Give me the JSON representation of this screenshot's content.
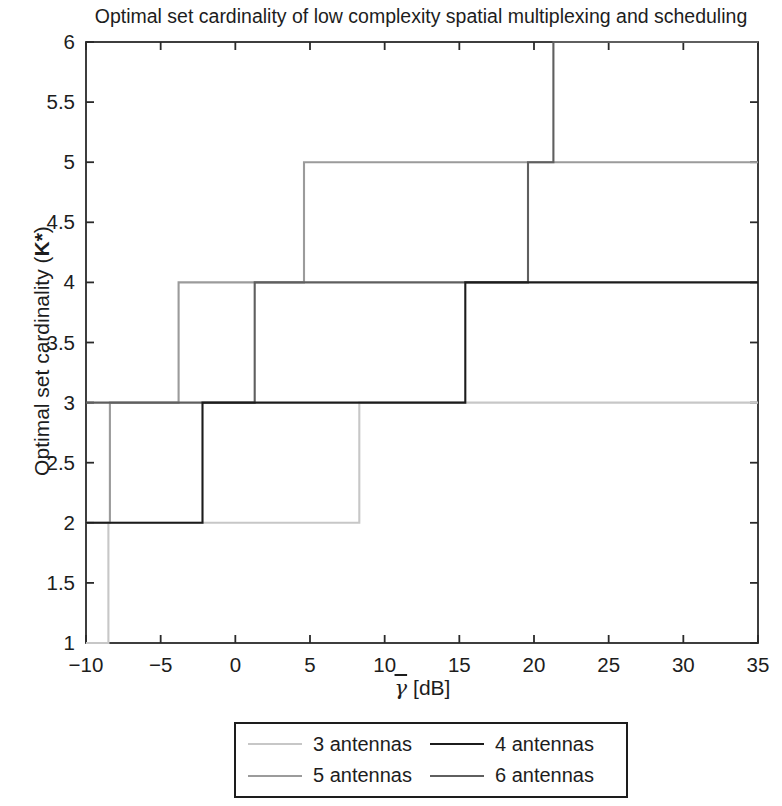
{
  "chart_data": {
    "type": "line",
    "style": "step",
    "title": "Optimal set cardinality of low complexity spatial multiplexing and scheduling",
    "xlabel_symbol": "γ",
    "xlabel_unit": "[dB]",
    "ylabel_prefix": "Optimal set cardinality (",
    "ylabel_k": "K*",
    "ylabel_suffix": ")",
    "xlim": [
      -10,
      35
    ],
    "ylim": [
      1,
      6
    ],
    "xticks": [
      -10,
      -5,
      0,
      5,
      10,
      15,
      20,
      25,
      30,
      35
    ],
    "yticks": [
      1,
      1.5,
      2,
      2.5,
      3,
      3.5,
      4,
      4.5,
      5,
      5.5,
      6
    ],
    "grid": false,
    "legend_position": "below",
    "axis_color": "#2a2a2a",
    "series": [
      {
        "name": "3 antennas",
        "color": "#c7c7c7",
        "points": [
          [
            -10,
            1
          ],
          [
            -8.5,
            1
          ],
          [
            -8.5,
            2
          ],
          [
            8.3,
            2
          ],
          [
            8.3,
            3
          ],
          [
            35,
            3
          ]
        ]
      },
      {
        "name": "4 antennas",
        "color": "#1c1c1c",
        "points": [
          [
            -10,
            2
          ],
          [
            -2.2,
            2
          ],
          [
            -2.2,
            3
          ],
          [
            15.4,
            3
          ],
          [
            15.4,
            4
          ],
          [
            35,
            4
          ]
        ]
      },
      {
        "name": "5 antennas",
        "color": "#9b9b9b",
        "points": [
          [
            -10,
            2
          ],
          [
            -8.4,
            2
          ],
          [
            -8.4,
            3
          ],
          [
            -3.8,
            3
          ],
          [
            -3.8,
            4
          ],
          [
            4.6,
            4
          ],
          [
            4.6,
            5
          ],
          [
            35,
            5
          ]
        ]
      },
      {
        "name": "6 antennas",
        "color": "#5f5f5f",
        "points": [
          [
            -10,
            3
          ],
          [
            1.3,
            3
          ],
          [
            1.3,
            4
          ],
          [
            19.6,
            4
          ],
          [
            19.6,
            5
          ],
          [
            21.3,
            5
          ],
          [
            21.3,
            6
          ],
          [
            35,
            6
          ]
        ]
      }
    ]
  }
}
